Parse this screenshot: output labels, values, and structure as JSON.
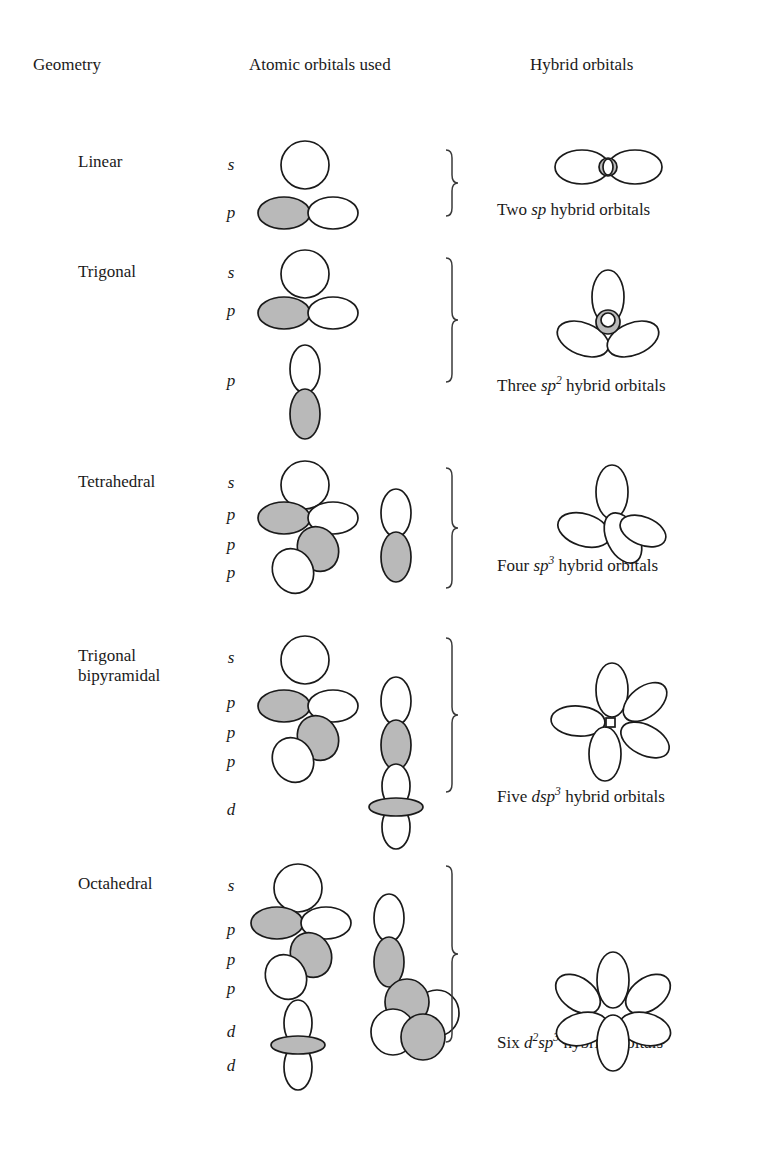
{
  "figure": {
    "colors": {
      "ink": "#1a1a1a",
      "shaded_lobe": "#b9b9b9",
      "open_lobe": "#ffffff",
      "brace": "#3a3a3a",
      "background": "#ffffff"
    }
  },
  "headers": {
    "geometry": "Geometry",
    "atomic_orbitals": "Atomic orbitals used",
    "hybrid_orbitals": "Hybrid orbitals"
  },
  "rows": [
    {
      "geometry": "Linear",
      "orbital_labels": [
        "s",
        "p"
      ],
      "atomic_orbitals": [
        "s",
        "p"
      ],
      "hybrid_count_word": "Two",
      "hybrid_symbol_plain": "sp",
      "hybrid_caption": "Two sp hybrid orbitals",
      "hybrid_lobes": 2
    },
    {
      "geometry": "Trigonal",
      "orbital_labels": [
        "s",
        "p",
        "p"
      ],
      "atomic_orbitals": [
        "s",
        "p",
        "p"
      ],
      "hybrid_count_word": "Three",
      "hybrid_symbol_plain": "sp2",
      "hybrid_caption": "Three sp2 hybrid orbitals",
      "hybrid_lobes": 3
    },
    {
      "geometry": "Tetrahedral",
      "orbital_labels": [
        "s",
        "p",
        "p",
        "p"
      ],
      "atomic_orbitals": [
        "s",
        "p",
        "p",
        "p"
      ],
      "hybrid_count_word": "Four",
      "hybrid_symbol_plain": "sp3",
      "hybrid_caption": "Four sp3 hybrid orbitals",
      "hybrid_lobes": 4
    },
    {
      "geometry": "Trigonal bipyramidal",
      "orbital_labels": [
        "s",
        "p",
        "p",
        "p",
        "d"
      ],
      "atomic_orbitals": [
        "s",
        "p",
        "p",
        "p",
        "d"
      ],
      "hybrid_count_word": "Five",
      "hybrid_symbol_plain": "dsp3",
      "hybrid_caption": "Five dsp3 hybrid orbitals",
      "hybrid_lobes": 5
    },
    {
      "geometry": "Octahedral",
      "orbital_labels": [
        "s",
        "p",
        "p",
        "p",
        "d",
        "d"
      ],
      "atomic_orbitals": [
        "s",
        "p",
        "p",
        "p",
        "d",
        "d"
      ],
      "hybrid_count_word": "Six",
      "hybrid_symbol_plain": "d2sp3",
      "hybrid_caption": "Six d2sp3 hybrid orbitals",
      "hybrid_lobes": 6
    }
  ]
}
